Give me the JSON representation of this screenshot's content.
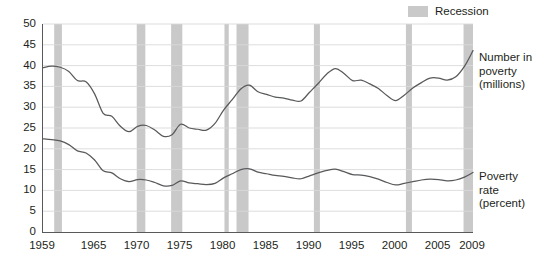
{
  "legend": {
    "swatch_name": "recession-swatch",
    "label": "Recession",
    "color": "#c9c9c9"
  },
  "series_labels": {
    "number_in_poverty": "Number in\npoverty\n(millions)",
    "number_in_poverty_lines": [
      "Number in",
      "poverty",
      "(millions)"
    ],
    "poverty_rate": "Poverty\nrate\n(percent)",
    "poverty_rate_lines": [
      "Poverty",
      "rate",
      "(percent)"
    ]
  },
  "chart_data": {
    "type": "line",
    "title": "",
    "subtitle": "",
    "xlabel": "",
    "ylabel": "",
    "xlim": [
      1959,
      2009
    ],
    "ylim": [
      0,
      50
    ],
    "grid": true,
    "grid_axis": "y",
    "legend_position": "top-right",
    "line_color": "#58595b",
    "recession_color": "#c9c9c9",
    "axis_color": "#58595b",
    "gridline_color": "#d9d9d9",
    "xticks": [
      1959,
      1965,
      1970,
      1975,
      1980,
      1985,
      1990,
      1995,
      2000,
      2005,
      2009
    ],
    "xtick_labels": [
      "1959",
      "1965",
      "1970",
      "1975",
      "1980",
      "1985",
      "1990",
      "1995",
      "2000",
      "2005",
      "2009"
    ],
    "yticks": [
      0,
      5,
      10,
      15,
      20,
      25,
      30,
      35,
      40,
      45,
      50
    ],
    "ytick_labels": [
      "0",
      "5",
      "10",
      "15",
      "20",
      "25",
      "30",
      "35",
      "40",
      "45",
      "50"
    ],
    "x": [
      1959,
      1960,
      1961,
      1962,
      1963,
      1964,
      1965,
      1966,
      1967,
      1968,
      1969,
      1970,
      1971,
      1972,
      1973,
      1974,
      1975,
      1976,
      1977,
      1978,
      1979,
      1980,
      1981,
      1982,
      1983,
      1984,
      1985,
      1986,
      1987,
      1988,
      1989,
      1990,
      1991,
      1992,
      1993,
      1994,
      1995,
      1996,
      1997,
      1998,
      1999,
      2000,
      2001,
      2002,
      2003,
      2004,
      2005,
      2006,
      2007,
      2008,
      2009
    ],
    "series": [
      {
        "name": "Number in poverty (millions)",
        "label_on_chart": "Number in poverty (millions)",
        "units": "millions",
        "values": [
          39.5,
          39.9,
          39.6,
          38.6,
          36.4,
          36.1,
          33.2,
          28.5,
          27.8,
          25.4,
          24.1,
          25.4,
          25.6,
          24.5,
          23.0,
          23.4,
          25.9,
          25.0,
          24.7,
          24.5,
          26.1,
          29.3,
          31.8,
          34.4,
          35.3,
          33.7,
          33.1,
          32.4,
          32.2,
          31.7,
          31.5,
          33.6,
          35.7,
          38.0,
          39.3,
          38.1,
          36.4,
          36.5,
          35.6,
          34.5,
          32.8,
          31.6,
          32.9,
          34.6,
          35.9,
          37.0,
          37.0,
          36.5,
          37.3,
          39.8,
          43.6
        ]
      },
      {
        "name": "Poverty rate (percent)",
        "label_on_chart": "Poverty rate (percent)",
        "units": "percent",
        "values": [
          22.4,
          22.2,
          21.9,
          21.0,
          19.5,
          19.0,
          17.3,
          14.7,
          14.2,
          12.8,
          12.1,
          12.6,
          12.5,
          11.9,
          11.1,
          11.2,
          12.3,
          11.8,
          11.6,
          11.4,
          11.7,
          13.0,
          14.0,
          15.0,
          15.2,
          14.4,
          14.0,
          13.6,
          13.4,
          13.0,
          12.8,
          13.5,
          14.2,
          14.8,
          15.1,
          14.5,
          13.8,
          13.7,
          13.3,
          12.7,
          11.9,
          11.3,
          11.7,
          12.1,
          12.5,
          12.7,
          12.6,
          12.3,
          12.5,
          13.2,
          14.3
        ]
      }
    ],
    "recessions": [
      {
        "start": 1960.3,
        "end": 1961.2
      },
      {
        "start": 1969.9,
        "end": 1970.9
      },
      {
        "start": 1973.9,
        "end": 1975.2
      },
      {
        "start": 1980.1,
        "end": 1980.6
      },
      {
        "start": 1981.5,
        "end": 1982.9
      },
      {
        "start": 1990.5,
        "end": 1991.2
      },
      {
        "start": 2001.2,
        "end": 2001.9
      },
      {
        "start": 2007.9,
        "end": 2009.5
      }
    ]
  }
}
